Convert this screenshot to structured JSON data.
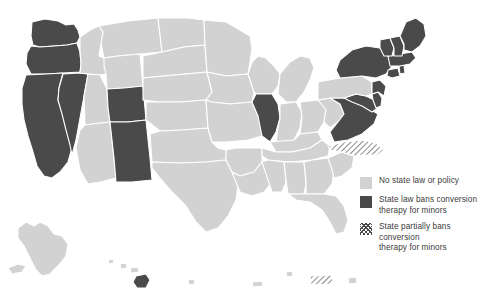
{
  "map": {
    "title": "State conversion therapy laws for minors",
    "colors": {
      "no_law": "#d2d2d2",
      "ban": "#4a4a4a",
      "partial_hatch": "#4a4a4a",
      "border": "#ffffff",
      "background": "#ffffff"
    },
    "categories": {
      "no_law": "No state law or policy",
      "ban": "State law bans conversion therapy for minors",
      "partial": "State partially bans conversion therapy for minors"
    },
    "states": {
      "ban": [
        "Washington",
        "Oregon",
        "California",
        "Nevada",
        "Colorado",
        "New Mexico",
        "Illinois",
        "New York",
        "Vermont",
        "New Hampshire",
        "Maine",
        "Massachusetts",
        "Rhode Island",
        "Connecticut",
        "New Jersey",
        "Delaware",
        "Maryland",
        "Virginia",
        "Hawaii"
      ],
      "partial": [
        "North Carolina",
        "Puerto Rico"
      ],
      "no_law": [
        "Alaska",
        "Idaho",
        "Montana",
        "Wyoming",
        "Utah",
        "Arizona",
        "North Dakota",
        "South Dakota",
        "Nebraska",
        "Kansas",
        "Oklahoma",
        "Texas",
        "Minnesota",
        "Iowa",
        "Missouri",
        "Arkansas",
        "Louisiana",
        "Wisconsin",
        "Michigan",
        "Indiana",
        "Ohio",
        "Kentucky",
        "Tennessee",
        "Mississippi",
        "Alabama",
        "Georgia",
        "Florida",
        "South Carolina",
        "West Virginia",
        "Pennsylvania"
      ]
    }
  },
  "legend": {
    "items": [
      {
        "swatch": "no-law-swatch",
        "label": "No state law or policy"
      },
      {
        "swatch": "ban-swatch",
        "label": "State law bans conversion\ntherapy for minors"
      },
      {
        "swatch": "partial-swatch",
        "label": "State partially bans conversion\ntherapy for minors"
      }
    ],
    "item_0_label": "No state law or policy",
    "item_1_label_line1": "State law bans conversion",
    "item_1_label_line2": "therapy for minors",
    "item_2_label_line1": "State partially bans conversion",
    "item_2_label_line2": "therapy for minors"
  }
}
